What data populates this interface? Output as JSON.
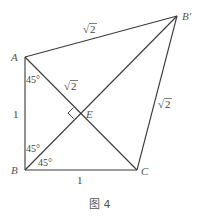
{
  "figure": {
    "caption": "图 4",
    "points": {
      "A": {
        "label": "A",
        "x": 25,
        "y": 57
      },
      "B": {
        "label": "B",
        "x": 25,
        "y": 170
      },
      "C": {
        "label": "C",
        "x": 137,
        "y": 170
      },
      "Bp": {
        "label": "B′",
        "x": 177,
        "y": 16
      },
      "E": {
        "label": "E",
        "x": 79,
        "y": 113
      }
    },
    "segments": [
      {
        "from": "A",
        "to": "B",
        "label": "1"
      },
      {
        "from": "B",
        "to": "C",
        "label": "1"
      },
      {
        "from": "A",
        "to": "Bp",
        "label": "√2"
      },
      {
        "from": "Bp",
        "to": "C",
        "label": "√2"
      },
      {
        "from": "A",
        "to": "C",
        "label": "√2"
      },
      {
        "from": "B",
        "to": "Bp",
        "label": ""
      }
    ],
    "labels": {
      "AB": "1",
      "BC": "1",
      "ABp": "2",
      "BpC": "2",
      "AE": "2",
      "sqrt_symbol": "√"
    },
    "angles": {
      "at_A": "45°",
      "at_B_upper": "45°",
      "at_B_lower": "45°"
    },
    "right_angle_at": "E"
  }
}
